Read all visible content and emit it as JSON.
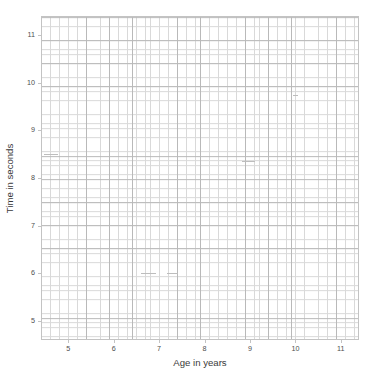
{
  "chart_data": {
    "type": "scatter",
    "title": "",
    "xlabel": "Age in years",
    "ylabel": "Time in seconds",
    "xlim": [
      4.4,
      11.4
    ],
    "ylim": [
      4.6,
      11.4
    ],
    "xticks": [
      5,
      6,
      7,
      8,
      9,
      10,
      11
    ],
    "yticks": [
      5,
      6,
      7,
      8,
      9,
      10,
      11
    ],
    "xtick_labels": [
      "5",
      "6",
      "7",
      "8",
      "9",
      "10",
      "11"
    ],
    "ytick_labels": [
      "5",
      "6",
      "7",
      "8",
      "9",
      "10",
      "11"
    ],
    "grid": true,
    "grid_major_step": 0.5,
    "grid_minor_step": 0.1,
    "legend": null,
    "series": [
      {
        "name": "",
        "x": [],
        "y": []
      }
    ],
    "annotations": [
      {
        "name": "faint-mark-a",
        "x": 4.47,
        "y": 8.5,
        "width": 0.3
      },
      {
        "name": "faint-mark-b",
        "x": 6.6,
        "y": 6.0,
        "width": 0.34
      },
      {
        "name": "faint-mark-c",
        "x": 7.18,
        "y": 6.0,
        "width": 0.24
      },
      {
        "name": "faint-mark-d",
        "x": 8.82,
        "y": 8.35,
        "width": 0.3
      },
      {
        "name": "faint-mark-e",
        "x": 9.95,
        "y": 9.75,
        "width": 0.1
      }
    ]
  },
  "axes": {
    "x": {
      "title": "Age in years",
      "ticks": [
        {
          "value": 5,
          "label": "5"
        },
        {
          "value": 6,
          "label": "6"
        },
        {
          "value": 7,
          "label": "7"
        },
        {
          "value": 8,
          "label": "8"
        },
        {
          "value": 9,
          "label": "9"
        },
        {
          "value": 10,
          "label": "10"
        },
        {
          "value": 11,
          "label": "11"
        }
      ]
    },
    "y": {
      "title": "Time in seconds",
      "ticks": [
        {
          "value": 11,
          "label": "11"
        },
        {
          "value": 10,
          "label": "10"
        },
        {
          "value": 9,
          "label": "9"
        },
        {
          "value": 8,
          "label": "8"
        },
        {
          "value": 7,
          "label": "7"
        },
        {
          "value": 6,
          "label": "6"
        },
        {
          "value": 5,
          "label": "5"
        }
      ]
    }
  },
  "colors": {
    "background": "#ffffff",
    "grid_major": "#b9b9b9",
    "grid_minor": "#d9d9d9",
    "axis_border": "#c3c3c3",
    "tick_text": "#4d4d4d",
    "label_text": "#3a3a3a",
    "mark": "#bdbdbd"
  }
}
